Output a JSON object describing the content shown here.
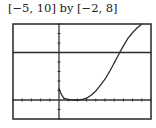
{
  "caption": "[−5, 10] by [−2, 8]",
  "chart_data": {
    "type": "line",
    "title": "[−5, 10] by [−2, 8]",
    "xlabel": "",
    "ylabel": "",
    "xlim": [
      -5,
      10
    ],
    "ylim": [
      -2,
      8
    ],
    "xscale_ticks": 1,
    "yscale_ticks": 1,
    "grid": false,
    "legend": null,
    "series": [
      {
        "name": "f(x)",
        "style": "dotted-calculator",
        "points": [
          [
            0,
            1.2
          ],
          [
            0.2,
            0.7
          ],
          [
            0.5,
            0.2
          ],
          [
            1,
            0.05
          ],
          [
            1.5,
            0
          ],
          [
            2,
            0
          ],
          [
            2.5,
            0.05
          ],
          [
            3,
            0.2
          ],
          [
            3.5,
            0.5
          ],
          [
            4,
            0.95
          ],
          [
            4.5,
            1.55
          ],
          [
            5,
            2.2
          ],
          [
            5.5,
            3.0
          ],
          [
            6,
            3.9
          ],
          [
            6.6,
            5.0
          ],
          [
            7,
            5.7
          ],
          [
            7.5,
            6.5
          ],
          [
            8,
            7.1
          ],
          [
            8.5,
            7.6
          ],
          [
            9,
            8.0
          ]
        ]
      },
      {
        "name": "y = 5",
        "style": "solid",
        "points": [
          [
            -5,
            5
          ],
          [
            10,
            5
          ]
        ]
      }
    ],
    "annotations": []
  }
}
